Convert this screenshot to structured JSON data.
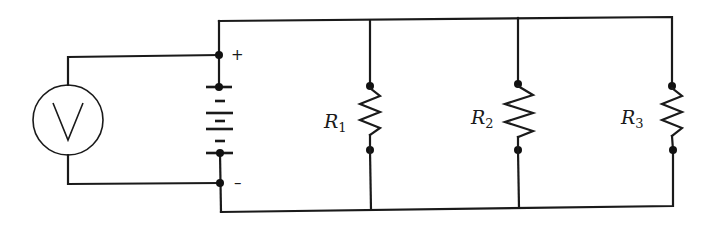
{
  "diagram": {
    "type": "parallel-resistor-circuit",
    "colors": {
      "ink": "#1a1a1a",
      "background": "#ffffff"
    },
    "voltmeter": {
      "symbol": "V"
    },
    "battery": {
      "positive_label": "+",
      "negative_label": "–",
      "cells": 3
    },
    "resistors": [
      {
        "letter": "R",
        "subscript": "1"
      },
      {
        "letter": "R",
        "subscript": "2"
      },
      {
        "letter": "R",
        "subscript": "3"
      }
    ]
  }
}
